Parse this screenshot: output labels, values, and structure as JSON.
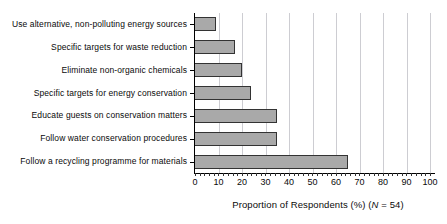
{
  "chart_data": {
    "type": "bar",
    "orientation": "horizontal",
    "categories": [
      "Use alternative, non-polluting energy sources",
      "Specific targets for waste reduction",
      "Eliminate non-organic chemicals",
      "Specific targets for energy conservation",
      "Educate guests on conservation matters",
      "Follow water conservation procedures",
      "Follow a recycling programme for materials"
    ],
    "values": [
      9,
      17,
      20,
      24,
      35,
      35,
      65
    ],
    "xticks": [
      0,
      10,
      20,
      30,
      40,
      50,
      60,
      70,
      80,
      90,
      100
    ],
    "xlim": [
      0,
      100
    ],
    "minor_tick_step": 2,
    "xlabel_prefix": "Proportion of Respondents (%) (",
    "n_symbol": "N",
    "xlabel_suffix": " = 54)",
    "title": "",
    "ylabel": "",
    "grid": "vertical",
    "legend": "none",
    "colors": {
      "bar_fill": "#a9a9a9",
      "bar_border": "#333333",
      "gridline": "#cdcdd2",
      "axis": "#000000",
      "text": "#0a0a0a",
      "background": "#ffffff"
    }
  }
}
